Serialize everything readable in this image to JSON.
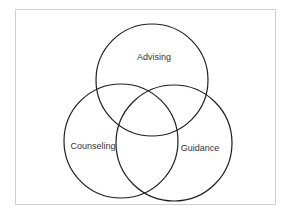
{
  "diagram": {
    "type": "venn",
    "frame": {
      "x": 15,
      "y": 9,
      "width": 261,
      "height": 196,
      "border_color": "#cfcfcf"
    },
    "stroke_color": "#1e1e1e",
    "text_color": "#333333",
    "sets": [
      {
        "id": "advising",
        "label": "Advising",
        "cx": 152,
        "cy": 80,
        "r": 56,
        "label_x": 154,
        "label_y": 57
      },
      {
        "id": "counseling",
        "label": "Counseling",
        "cx": 121,
        "cy": 141,
        "r": 57,
        "label_x": 93,
        "label_y": 146
      },
      {
        "id": "guidance",
        "label": "Guidance",
        "cx": 174,
        "cy": 143,
        "r": 58,
        "label_x": 200,
        "label_y": 148
      }
    ]
  }
}
